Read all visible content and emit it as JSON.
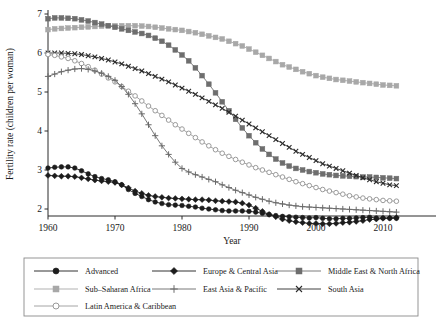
{
  "chart_data": {
    "type": "line",
    "title": "",
    "xlabel": "Year",
    "ylabel": "Fertility rate (children per woman)",
    "xlim": [
      1958,
      2013
    ],
    "ylim": [
      1.55,
      7.15
    ],
    "xticks": [
      1960,
      1970,
      1980,
      1990,
      2000,
      2010
    ],
    "yticks": [
      2,
      3,
      4,
      5,
      6,
      7
    ],
    "grid": false,
    "legend_position": "below-plot",
    "x": [
      1960,
      1961,
      1962,
      1963,
      1964,
      1965,
      1966,
      1967,
      1968,
      1969,
      1970,
      1971,
      1972,
      1973,
      1974,
      1975,
      1976,
      1977,
      1978,
      1979,
      1980,
      1981,
      1982,
      1983,
      1984,
      1985,
      1986,
      1987,
      1988,
      1989,
      1990,
      1991,
      1992,
      1993,
      1994,
      1995,
      1996,
      1997,
      1998,
      1999,
      2000,
      2001,
      2002,
      2003,
      2004,
      2005,
      2006,
      2007,
      2008,
      2009,
      2010,
      2011,
      2012
    ],
    "series": [
      {
        "name": "Advanced",
        "marker": "filled-circle",
        "color": "#1c1c1c",
        "values": [
          3.05,
          3.07,
          3.08,
          3.08,
          3.05,
          2.98,
          2.9,
          2.83,
          2.78,
          2.75,
          2.7,
          2.62,
          2.5,
          2.4,
          2.32,
          2.24,
          2.18,
          2.14,
          2.11,
          2.1,
          2.09,
          2.07,
          2.05,
          2.02,
          2.0,
          1.98,
          1.96,
          1.95,
          1.95,
          1.95,
          1.94,
          1.92,
          1.89,
          1.86,
          1.83,
          1.81,
          1.8,
          1.79,
          1.78,
          1.77,
          1.78,
          1.76,
          1.75,
          1.75,
          1.76,
          1.76,
          1.77,
          1.78,
          1.79,
          1.77,
          1.77,
          1.76,
          1.76
        ]
      },
      {
        "name": "Europe & Central Asia",
        "marker": "filled-diamond",
        "color": "#1c1c1c",
        "values": [
          2.86,
          2.85,
          2.84,
          2.84,
          2.83,
          2.8,
          2.77,
          2.74,
          2.72,
          2.7,
          2.68,
          2.62,
          2.54,
          2.46,
          2.4,
          2.35,
          2.32,
          2.3,
          2.28,
          2.27,
          2.26,
          2.25,
          2.24,
          2.24,
          2.23,
          2.21,
          2.2,
          2.19,
          2.18,
          2.15,
          2.1,
          2.02,
          1.94,
          1.86,
          1.8,
          1.74,
          1.7,
          1.67,
          1.65,
          1.63,
          1.63,
          1.62,
          1.62,
          1.63,
          1.65,
          1.66,
          1.68,
          1.7,
          1.73,
          1.74,
          1.76,
          1.77,
          1.78
        ]
      },
      {
        "name": "Middle East & North Africa",
        "marker": "filled-square",
        "color": "#6e6e6e",
        "values": [
          6.88,
          6.9,
          6.9,
          6.89,
          6.88,
          6.85,
          6.82,
          6.78,
          6.74,
          6.7,
          6.66,
          6.62,
          6.58,
          6.54,
          6.5,
          6.45,
          6.38,
          6.3,
          6.2,
          6.08,
          5.95,
          5.8,
          5.62,
          5.42,
          5.2,
          4.98,
          4.75,
          4.52,
          4.3,
          4.08,
          3.88,
          3.7,
          3.54,
          3.4,
          3.28,
          3.18,
          3.1,
          3.04,
          3.0,
          2.96,
          2.93,
          2.9,
          2.88,
          2.86,
          2.85,
          2.84,
          2.83,
          2.82,
          2.82,
          2.81,
          2.8,
          2.79,
          2.78
        ]
      },
      {
        "name": "Sub-Saharan Africa",
        "marker": "filled-square",
        "color": "#a8a8a8",
        "values": [
          6.6,
          6.62,
          6.63,
          6.64,
          6.65,
          6.66,
          6.67,
          6.68,
          6.69,
          6.7,
          6.7,
          6.7,
          6.7,
          6.7,
          6.69,
          6.68,
          6.66,
          6.64,
          6.62,
          6.6,
          6.58,
          6.55,
          6.52,
          6.48,
          6.44,
          6.4,
          6.36,
          6.3,
          6.24,
          6.18,
          6.1,
          6.02,
          5.94,
          5.86,
          5.78,
          5.7,
          5.64,
          5.58,
          5.52,
          5.47,
          5.42,
          5.38,
          5.35,
          5.32,
          5.3,
          5.28,
          5.26,
          5.24,
          5.22,
          5.2,
          5.18,
          5.17,
          5.16
        ]
      },
      {
        "name": "East Asia & Pacific",
        "marker": "plus",
        "color": "#6a6a6a",
        "values": [
          5.4,
          5.46,
          5.52,
          5.56,
          5.59,
          5.6,
          5.58,
          5.54,
          5.48,
          5.4,
          5.3,
          5.14,
          4.94,
          4.7,
          4.44,
          4.16,
          3.88,
          3.62,
          3.4,
          3.2,
          3.04,
          2.95,
          2.88,
          2.82,
          2.76,
          2.7,
          2.62,
          2.55,
          2.48,
          2.42,
          2.36,
          2.3,
          2.25,
          2.2,
          2.16,
          2.13,
          2.1,
          2.08,
          2.06,
          2.05,
          2.04,
          2.03,
          2.02,
          2.01,
          2.0,
          1.99,
          1.98,
          1.97,
          1.96,
          1.95,
          1.94,
          1.93,
          1.92
        ]
      },
      {
        "name": "South Asia",
        "marker": "cross",
        "color": "#2b2b2b",
        "values": [
          6.0,
          6.0,
          6.0,
          5.99,
          5.98,
          5.96,
          5.93,
          5.9,
          5.86,
          5.82,
          5.77,
          5.72,
          5.66,
          5.6,
          5.54,
          5.47,
          5.4,
          5.33,
          5.26,
          5.18,
          5.1,
          5.02,
          4.94,
          4.85,
          4.76,
          4.67,
          4.58,
          4.48,
          4.38,
          4.28,
          4.18,
          4.08,
          3.98,
          3.88,
          3.78,
          3.68,
          3.58,
          3.48,
          3.4,
          3.32,
          3.24,
          3.16,
          3.1,
          3.04,
          2.98,
          2.92,
          2.86,
          2.8,
          2.75,
          2.7,
          2.66,
          2.62,
          2.6
        ]
      },
      {
        "name": "Latin America & Caribbean",
        "marker": "open-circle",
        "color": "#9a9a9a",
        "values": [
          5.96,
          5.94,
          5.9,
          5.86,
          5.8,
          5.73,
          5.65,
          5.56,
          5.46,
          5.36,
          5.26,
          5.14,
          5.02,
          4.9,
          4.77,
          4.64,
          4.52,
          4.4,
          4.28,
          4.16,
          4.05,
          3.94,
          3.83,
          3.72,
          3.62,
          3.52,
          3.43,
          3.35,
          3.27,
          3.2,
          3.13,
          3.06,
          3.0,
          2.94,
          2.88,
          2.82,
          2.76,
          2.7,
          2.65,
          2.6,
          2.55,
          2.5,
          2.46,
          2.42,
          2.38,
          2.34,
          2.31,
          2.28,
          2.26,
          2.24,
          2.22,
          2.21,
          2.2
        ]
      }
    ]
  },
  "legend": {
    "entries": [
      {
        "label": "Advanced",
        "marker": "filled-circle",
        "color": "#1c1c1c"
      },
      {
        "label": "Europe & Central Asia",
        "marker": "filled-diamond",
        "color": "#1c1c1c"
      },
      {
        "label": "Middle East & North Africa",
        "marker": "filled-square",
        "color": "#6e6e6e"
      },
      {
        "label": "Sub–Saharan Africa",
        "marker": "filled-square",
        "color": "#a8a8a8"
      },
      {
        "label": "East Asia & Pacific",
        "marker": "plus",
        "color": "#6a6a6a"
      },
      {
        "label": "South Asia",
        "marker": "cross",
        "color": "#2b2b2b"
      },
      {
        "label": "Latin America & Caribbean",
        "marker": "open-circle",
        "color": "#9a9a9a"
      }
    ]
  }
}
